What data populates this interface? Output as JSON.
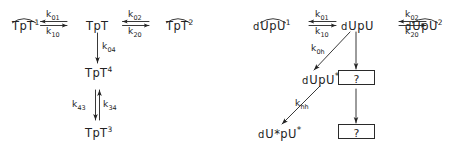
{
  "figure": {
    "type": "reaction-scheme-diagram",
    "background_color": "#ffffff",
    "ink_color": "#232323"
  },
  "schemes": [
    {
      "id": "tpt",
      "species": {
        "s1": {
          "prefix": "",
          "core": "TpT",
          "arc": true,
          "superscript": "1"
        },
        "s0": {
          "prefix": "",
          "core": "TpT",
          "arc": false,
          "superscript": ""
        },
        "s2": {
          "prefix": "",
          "core": "TpT",
          "arc": true,
          "superscript": "2"
        },
        "s4": {
          "prefix": "",
          "core": "TpT",
          "arc": false,
          "superscript": "4"
        },
        "s3": {
          "prefix": "",
          "core": "TpT",
          "arc": false,
          "superscript": "3"
        }
      },
      "rates": {
        "k01": {
          "symbol": "k",
          "sub": "01"
        },
        "k10": {
          "symbol": "k",
          "sub": "10"
        },
        "k02": {
          "symbol": "k",
          "sub": "02"
        },
        "k20": {
          "symbol": "k",
          "sub": "20"
        },
        "k04": {
          "symbol": "k",
          "sub": "04"
        },
        "k43": {
          "symbol": "k",
          "sub": "43"
        },
        "k34": {
          "symbol": "k",
          "sub": "34"
        }
      }
    },
    {
      "id": "dupu",
      "species": {
        "s1": {
          "prefix": "d",
          "core": "UpU",
          "arc": true,
          "superscript": "1"
        },
        "s0": {
          "prefix": "d",
          "core": "UpU",
          "arc": false,
          "superscript": ""
        },
        "s2": {
          "prefix": "d",
          "core": "UpU",
          "arc": true,
          "superscript": "2"
        },
        "sh": {
          "prefix": "d",
          "core": "UpU",
          "arc": false,
          "superscript": "*"
        },
        "shh": {
          "prefix": "d",
          "core": "U*pU",
          "arc": false,
          "superscript": "*"
        }
      },
      "rates": {
        "k01": {
          "symbol": "k",
          "sub": "01"
        },
        "k10": {
          "symbol": "k",
          "sub": "10"
        },
        "k02": {
          "symbol": "k",
          "sub": "02"
        },
        "k20": {
          "symbol": "k",
          "sub": "20"
        },
        "k0h": {
          "symbol": "k",
          "sub": "0h"
        },
        "khh": {
          "symbol": "k",
          "sub": "hh"
        }
      },
      "unknown_boxes": [
        {
          "label": "?"
        },
        {
          "label": "?"
        }
      ]
    }
  ]
}
